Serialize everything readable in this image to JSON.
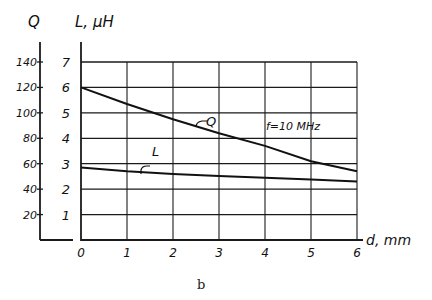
{
  "figure": {
    "caption": "b",
    "annotation": "f=10 MHz",
    "q_axis_title": "Q",
    "l_axis_title": "L, μH",
    "x_axis_title": "d, mm",
    "curve_labels": {
      "q": "Q",
      "l": "L"
    }
  },
  "chart_data": {
    "type": "line",
    "title": "",
    "xlabel": "d, mm",
    "ylabel": "L, μH",
    "ylabel_secondary": "Q",
    "x": [
      0,
      1,
      2,
      3,
      4,
      5,
      6
    ],
    "xlim": [
      0,
      6
    ],
    "ylim": [
      0,
      7
    ],
    "ylim_secondary": [
      0,
      140
    ],
    "x_ticks": [
      "0",
      "1",
      "2",
      "3",
      "4",
      "5",
      "6"
    ],
    "y_ticks": [
      "1",
      "2",
      "3",
      "4",
      "5",
      "6",
      "7"
    ],
    "y_ticks_secondary": [
      "20",
      "40",
      "60",
      "80",
      "100",
      "120",
      "140"
    ],
    "grid": true,
    "annotations": [
      "f=10 MHz"
    ],
    "series": [
      {
        "name": "Q",
        "axis": "secondary",
        "values": [
          120,
          107,
          95,
          84,
          74,
          62,
          54
        ]
      },
      {
        "name": "L",
        "axis": "primary",
        "values": [
          2.85,
          2.7,
          2.6,
          2.52,
          2.45,
          2.38,
          2.3
        ]
      }
    ]
  }
}
